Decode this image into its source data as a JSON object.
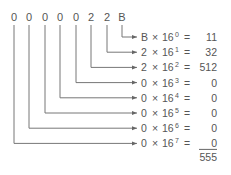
{
  "diagram": {
    "hex_digits": [
      "0",
      "0",
      "0",
      "0",
      "0",
      "2",
      "2",
      "B"
    ],
    "rows": [
      {
        "digit": "B",
        "power": "0",
        "value": "11"
      },
      {
        "digit": "2",
        "power": "1",
        "value": "32"
      },
      {
        "digit": "2",
        "power": "2",
        "value": "512"
      },
      {
        "digit": "0",
        "power": "3",
        "value": "0"
      },
      {
        "digit": "0",
        "power": "4",
        "value": "0"
      },
      {
        "digit": "0",
        "power": "5",
        "value": "0"
      },
      {
        "digit": "0",
        "power": "6",
        "value": "0"
      },
      {
        "digit": "0",
        "power": "7",
        "value": "0"
      }
    ],
    "base": "16",
    "times": "×",
    "equals": "=",
    "total": "555"
  }
}
